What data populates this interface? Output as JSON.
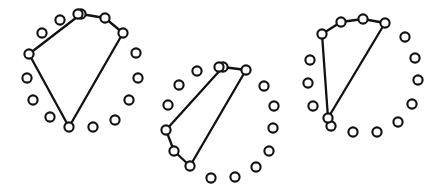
{
  "figure": {
    "width": 447,
    "height": 195,
    "background_color": "#ffffff",
    "stroke_color": "#111111",
    "node_fill_color": "#ffffff",
    "node_radius": 4.6,
    "node_stroke_width": 2.1,
    "polygon_stroke_width": 2.3
  },
  "diagrams": [
    {
      "id": "diagram-left",
      "label": "Left diagram",
      "node_count": 16,
      "nodes": [
        {
          "id": "L0",
          "x": 81,
          "y": 14
        },
        {
          "id": "L1",
          "x": 105,
          "y": 18
        },
        {
          "id": "L2",
          "x": 123,
          "y": 33
        },
        {
          "id": "L3",
          "x": 136,
          "y": 53
        },
        {
          "id": "L4",
          "x": 138,
          "y": 78
        },
        {
          "id": "L5",
          "x": 129,
          "y": 100
        },
        {
          "id": "L6",
          "x": 115,
          "y": 120
        },
        {
          "id": "L7",
          "x": 93,
          "y": 127
        },
        {
          "id": "L8",
          "x": 69,
          "y": 127
        },
        {
          "id": "L9",
          "x": 50,
          "y": 117
        },
        {
          "id": "L10",
          "x": 33,
          "y": 100
        },
        {
          "id": "L11",
          "x": 27,
          "y": 78
        },
        {
          "id": "L12",
          "x": 29,
          "y": 54
        },
        {
          "id": "L13",
          "x": 42,
          "y": 33
        },
        {
          "id": "L14",
          "x": 60,
          "y": 20
        },
        {
          "id": "L15",
          "x": 78,
          "y": 14
        }
      ],
      "polygon_vertices": [
        "L12",
        "L0",
        "L1",
        "L2",
        "L8"
      ],
      "polygon_closed": true
    },
    {
      "id": "diagram-middle",
      "label": "Middle diagram",
      "node_count": 16,
      "nodes": [
        {
          "id": "M0",
          "x": 223,
          "y": 67
        },
        {
          "id": "M1",
          "x": 246,
          "y": 70
        },
        {
          "id": "M2",
          "x": 264,
          "y": 86
        },
        {
          "id": "M3",
          "x": 274,
          "y": 106
        },
        {
          "id": "M4",
          "x": 273,
          "y": 128
        },
        {
          "id": "M5",
          "x": 269,
          "y": 151
        },
        {
          "id": "M6",
          "x": 256,
          "y": 167
        },
        {
          "id": "M7",
          "x": 235,
          "y": 177
        },
        {
          "id": "M8",
          "x": 211,
          "y": 178
        },
        {
          "id": "M9",
          "x": 190,
          "y": 166
        },
        {
          "id": "M10",
          "x": 174,
          "y": 151
        },
        {
          "id": "M11",
          "x": 166,
          "y": 130
        },
        {
          "id": "M12",
          "x": 168,
          "y": 105
        },
        {
          "id": "M13",
          "x": 179,
          "y": 85
        },
        {
          "id": "M14",
          "x": 197,
          "y": 71
        },
        {
          "id": "M15",
          "x": 219,
          "y": 67
        }
      ],
      "polygon_vertices": [
        "M0",
        "M1",
        "M9",
        "M10",
        "M11"
      ],
      "polygon_closed": true
    },
    {
      "id": "diagram-right",
      "label": "Right diagram",
      "node_count": 16,
      "nodes": [
        {
          "id": "R0",
          "x": 363,
          "y": 19
        },
        {
          "id": "R1",
          "x": 385,
          "y": 23
        },
        {
          "id": "R2",
          "x": 405,
          "y": 37
        },
        {
          "id": "R3",
          "x": 415,
          "y": 58
        },
        {
          "id": "R4",
          "x": 418,
          "y": 80
        },
        {
          "id": "R5",
          "x": 412,
          "y": 104
        },
        {
          "id": "R6",
          "x": 398,
          "y": 122
        },
        {
          "id": "R7",
          "x": 377,
          "y": 132
        },
        {
          "id": "R8",
          "x": 353,
          "y": 132
        },
        {
          "id": "R9",
          "x": 331,
          "y": 126
        },
        {
          "id": "R10",
          "x": 313,
          "y": 106
        },
        {
          "id": "R11",
          "x": 308,
          "y": 83
        },
        {
          "id": "R12",
          "x": 310,
          "y": 60
        },
        {
          "id": "R13",
          "x": 322,
          "y": 34
        },
        {
          "id": "R14",
          "x": 341,
          "y": 22
        },
        {
          "id": "R15",
          "x": 328,
          "y": 118
        }
      ],
      "polygon_vertices": [
        "R13",
        "R14",
        "R0",
        "R1",
        "R15"
      ],
      "polygon_closed": true
    }
  ]
}
